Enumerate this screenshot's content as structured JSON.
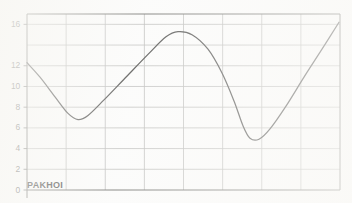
{
  "chart_data": {
    "type": "line",
    "title": "",
    "subtitle": "",
    "xlabel": "",
    "ylabel": "",
    "annotations": [
      "PAKHOI"
    ],
    "series_label": "PAKHOI",
    "grid": true,
    "legend_position": "none",
    "ylim": [
      0,
      17
    ],
    "xlim": [
      0,
      12
    ],
    "ytick_values": [
      0,
      2,
      4,
      6,
      8,
      10,
      12,
      16
    ],
    "ytick_labels": [
      "0",
      "2",
      "4",
      "6",
      "8",
      "10",
      "12",
      "16"
    ],
    "gridline_y_values": [
      0,
      2,
      4,
      6,
      8,
      10,
      12,
      14,
      16
    ],
    "gridline_x_count": 9,
    "xtick_labels": [],
    "line_color": "#4a4a48",
    "grid_color": "#b9b9b6",
    "axis_color": "#6e6e6b",
    "series": [
      {
        "name": "PAKHOI",
        "x": [
          0.0,
          0.5,
          1.0,
          1.5,
          2.0,
          2.5,
          3.0,
          3.5,
          4.0,
          4.5,
          5.0,
          5.5,
          6.0,
          6.5,
          7.0,
          7.5,
          8.0,
          8.5,
          9.0,
          9.5,
          10.0,
          10.5,
          11.0,
          11.5,
          12.0
        ],
        "values": [
          12.3,
          11.3,
          10.3,
          9.2,
          8.1,
          7.2,
          6.8,
          6.9,
          7.6,
          8.8,
          10.1,
          11.5,
          12.9,
          14.2,
          15.1,
          15.3,
          14.9,
          13.8,
          12.2,
          10.3,
          8.3,
          6.4,
          5.2,
          4.9,
          5.3
        ]
      }
    ],
    "curve_points": [
      {
        "x": 27,
        "y": 12.3
      },
      {
        "x": 40,
        "y": 10.9
      },
      {
        "x": 55,
        "y": 9.0
      },
      {
        "x": 68,
        "y": 7.4
      },
      {
        "x": 78,
        "y": 6.8
      },
      {
        "x": 88,
        "y": 7.2
      },
      {
        "x": 104,
        "y": 8.7
      },
      {
        "x": 124,
        "y": 10.7
      },
      {
        "x": 148,
        "y": 13.1
      },
      {
        "x": 166,
        "y": 14.8
      },
      {
        "x": 178,
        "y": 15.3
      },
      {
        "x": 192,
        "y": 15.0
      },
      {
        "x": 208,
        "y": 13.6
      },
      {
        "x": 222,
        "y": 11.3
      },
      {
        "x": 234,
        "y": 8.6
      },
      {
        "x": 243,
        "y": 6.2
      },
      {
        "x": 250,
        "y": 5.0
      },
      {
        "x": 259,
        "y": 4.9
      },
      {
        "x": 270,
        "y": 5.9
      },
      {
        "x": 286,
        "y": 8.1
      },
      {
        "x": 304,
        "y": 10.9
      },
      {
        "x": 322,
        "y": 13.6
      },
      {
        "x": 339,
        "y": 16.2
      }
    ]
  },
  "axis": {
    "y_labels": [
      {
        "text": "16",
        "value": 16
      },
      {
        "text": "12",
        "value": 12
      },
      {
        "text": "10",
        "value": 10
      },
      {
        "text": "8",
        "value": 8
      },
      {
        "text": "6",
        "value": 6
      },
      {
        "text": "4",
        "value": 4
      },
      {
        "text": "2",
        "value": 2
      },
      {
        "text": "0",
        "value": 0
      }
    ]
  }
}
